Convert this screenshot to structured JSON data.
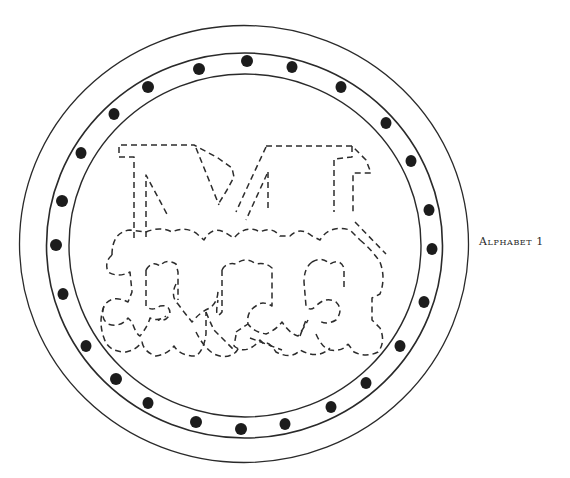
{
  "caption": {
    "title": "Alphabet 1"
  },
  "pattern": {
    "subject": "monogram-medallion",
    "letter": "M",
    "dot_count": 24,
    "colors": {
      "line": "#2a2a2a",
      "dot": "#1c1c1c",
      "background": "#ffffff"
    }
  }
}
